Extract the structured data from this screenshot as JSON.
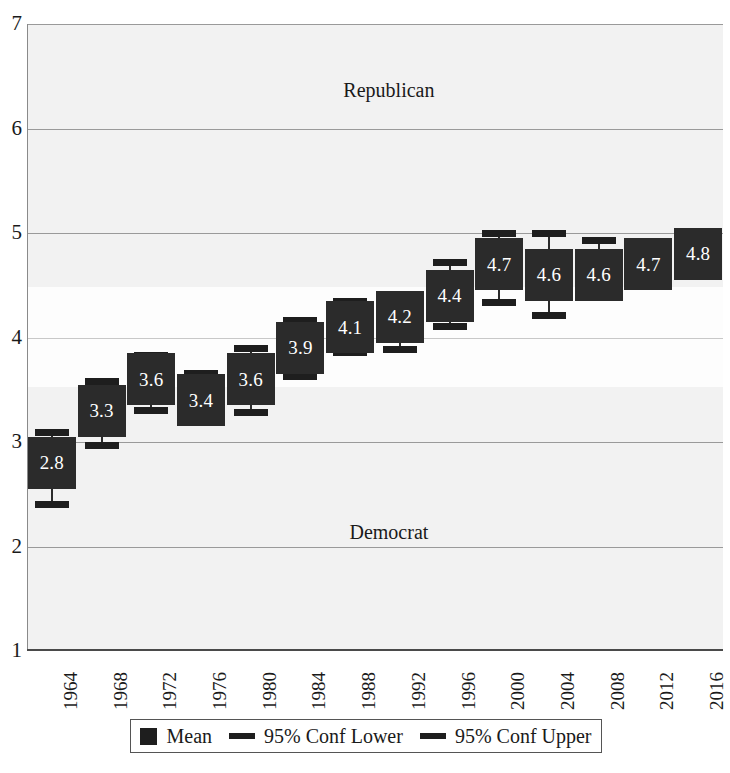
{
  "chart_data": {
    "type": "bar",
    "title": "",
    "subtitle": "",
    "xlabel": "",
    "ylabel": "",
    "ylim": [
      1,
      7
    ],
    "yticks": [
      1,
      2,
      3,
      4,
      5,
      6,
      7
    ],
    "grid": true,
    "legend_position": "bottom",
    "categories": [
      "1964",
      "1968",
      "1972",
      "1976",
      "1980",
      "1984",
      "1988",
      "1992",
      "1996",
      "2000",
      "2004",
      "2008",
      "2012",
      "2016"
    ],
    "series": [
      {
        "name": "Mean",
        "values": [
          2.8,
          3.3,
          3.6,
          3.4,
          3.6,
          3.9,
          4.1,
          4.2,
          4.4,
          4.7,
          4.6,
          4.6,
          4.7,
          4.8
        ]
      },
      {
        "name": "95% Conf Lower",
        "values": [
          2.4,
          2.96,
          3.3,
          3.2,
          3.28,
          3.62,
          3.85,
          3.88,
          4.1,
          4.33,
          4.21,
          4.43,
          4.6,
          4.65
        ]
      },
      {
        "name": "95% Conf Upper",
        "values": [
          3.1,
          3.58,
          3.83,
          3.66,
          3.9,
          4.17,
          4.35,
          4.4,
          4.72,
          5.0,
          5.0,
          4.93,
          4.82,
          4.92
        ]
      }
    ],
    "data_labels": [
      "2.8",
      "3.3",
      "3.6",
      "3.4",
      "3.6",
      "3.9",
      "4.1",
      "4.2",
      "4.4",
      "4.7",
      "4.6",
      "4.6",
      "4.7",
      "4.8"
    ],
    "annotations": [
      {
        "text": "Republican",
        "x_frac": 0.52,
        "y_value": 6.35
      },
      {
        "text": "Democrat",
        "x_frac": 0.52,
        "y_value": 2.12
      }
    ],
    "colors": {
      "mean_box": "#2b2b2b",
      "whisker": "#1e1e1e",
      "plot_background": "#f2f2f2",
      "gridline": "#9a9a9a",
      "label_text": "#ffffff"
    }
  },
  "legend": {
    "entries": [
      {
        "label": "Mean",
        "marker": "box-swatch"
      },
      {
        "label": "95% Conf Lower",
        "marker": "dash-swatch"
      },
      {
        "label": "95% Conf Upper",
        "marker": "dash-swatch"
      }
    ]
  }
}
